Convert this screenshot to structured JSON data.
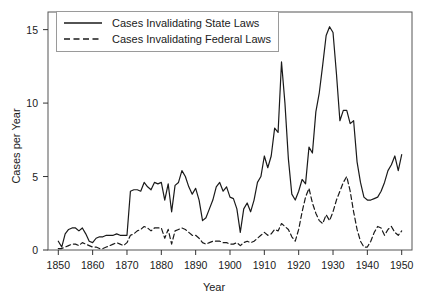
{
  "chart_data": {
    "type": "line",
    "title": "",
    "xlabel": "Year",
    "ylabel": "Cases per Year",
    "xlim": [
      1847,
      1953
    ],
    "ylim": [
      0,
      16.2
    ],
    "xticks": [
      1850,
      1860,
      1870,
      1880,
      1890,
      1900,
      1910,
      1920,
      1930,
      1940,
      1950
    ],
    "yticks": [
      0,
      5,
      10,
      15
    ],
    "grid": false,
    "legend_position": "upper-left",
    "series": [
      {
        "name": "Cases Invalidating State Laws",
        "style": "solid",
        "color": "#1a1a1a",
        "x": [
          1850,
          1851,
          1852,
          1853,
          1854,
          1855,
          1856,
          1857,
          1858,
          1859,
          1860,
          1861,
          1862,
          1863,
          1864,
          1865,
          1866,
          1867,
          1868,
          1869,
          1870,
          1871,
          1872,
          1873,
          1874,
          1875,
          1876,
          1877,
          1878,
          1879,
          1880,
          1881,
          1882,
          1883,
          1884,
          1885,
          1886,
          1887,
          1888,
          1889,
          1890,
          1891,
          1892,
          1893,
          1894,
          1895,
          1896,
          1897,
          1898,
          1899,
          1900,
          1901,
          1902,
          1903,
          1904,
          1905,
          1906,
          1907,
          1908,
          1909,
          1910,
          1911,
          1912,
          1913,
          1914,
          1915,
          1916,
          1917,
          1918,
          1919,
          1920,
          1921,
          1922,
          1923,
          1924,
          1925,
          1926,
          1927,
          1928,
          1929,
          1930,
          1931,
          1932,
          1933,
          1934,
          1935,
          1936,
          1937,
          1938,
          1939,
          1940,
          1941,
          1942,
          1943,
          1944,
          1945,
          1946,
          1947,
          1948,
          1949,
          1950
        ],
        "values": [
          0.6,
          0.2,
          1.1,
          1.4,
          1.5,
          1.5,
          1.3,
          1.5,
          1.1,
          0.6,
          0.5,
          0.8,
          0.9,
          0.9,
          1.0,
          1.0,
          1.0,
          1.1,
          1.0,
          1.0,
          1.0,
          4.0,
          4.1,
          4.1,
          4.0,
          4.6,
          4.3,
          4.1,
          4.6,
          4.5,
          4.6,
          3.4,
          4.5,
          2.6,
          4.4,
          4.6,
          5.4,
          5.0,
          4.3,
          3.8,
          4.2,
          3.4,
          2.0,
          2.2,
          2.8,
          3.4,
          4.3,
          4.6,
          4.0,
          4.3,
          3.6,
          3.5,
          2.8,
          1.2,
          2.8,
          3.2,
          2.6,
          3.4,
          4.6,
          5.0,
          6.4,
          5.6,
          6.4,
          8.3,
          8.0,
          12.8,
          10.0,
          6.2,
          3.8,
          3.4,
          4.0,
          4.8,
          4.5,
          7.0,
          6.6,
          9.4,
          10.7,
          12.6,
          14.6,
          15.2,
          14.8,
          12.0,
          8.8,
          9.5,
          9.5,
          8.6,
          8.8,
          6.0,
          4.6,
          3.6,
          3.4,
          3.4,
          3.5,
          3.6,
          4.0,
          4.6,
          5.4,
          5.8,
          6.4,
          5.4,
          6.5
        ]
      },
      {
        "name": "Cases Invalidating Federal Laws",
        "style": "dashed",
        "color": "#1a1a1a",
        "x": [
          1850,
          1851,
          1852,
          1853,
          1854,
          1855,
          1856,
          1857,
          1858,
          1859,
          1860,
          1861,
          1862,
          1863,
          1864,
          1865,
          1866,
          1867,
          1868,
          1869,
          1870,
          1871,
          1872,
          1873,
          1874,
          1875,
          1876,
          1877,
          1878,
          1879,
          1880,
          1881,
          1882,
          1883,
          1884,
          1885,
          1886,
          1887,
          1888,
          1889,
          1890,
          1891,
          1892,
          1893,
          1894,
          1895,
          1896,
          1897,
          1898,
          1899,
          1900,
          1901,
          1902,
          1903,
          1904,
          1905,
          1906,
          1907,
          1908,
          1909,
          1910,
          1911,
          1912,
          1913,
          1914,
          1915,
          1916,
          1917,
          1918,
          1919,
          1920,
          1921,
          1922,
          1923,
          1924,
          1925,
          1926,
          1927,
          1928,
          1929,
          1930,
          1931,
          1932,
          1933,
          1934,
          1935,
          1936,
          1937,
          1938,
          1939,
          1940,
          1941,
          1942,
          1943,
          1944,
          1945,
          1946,
          1947,
          1948,
          1949,
          1950
        ],
        "values": [
          0.1,
          0.1,
          0.2,
          0.3,
          0.4,
          0.4,
          0.3,
          0.5,
          0.4,
          0.3,
          0.2,
          0.2,
          0.1,
          0.1,
          0.2,
          0.3,
          0.4,
          0.5,
          0.4,
          0.3,
          0.5,
          1.0,
          1.1,
          1.3,
          1.4,
          1.6,
          1.5,
          1.3,
          1.5,
          1.5,
          1.5,
          0.8,
          1.4,
          0.4,
          1.3,
          1.4,
          1.5,
          1.4,
          1.2,
          1.0,
          1.0,
          0.8,
          0.5,
          0.4,
          0.5,
          0.6,
          0.6,
          0.6,
          0.5,
          0.5,
          0.4,
          0.4,
          0.5,
          0.3,
          0.5,
          0.6,
          0.5,
          0.6,
          0.8,
          1.0,
          1.2,
          1.0,
          1.1,
          1.4,
          1.3,
          1.8,
          1.6,
          1.4,
          0.9,
          0.6,
          1.4,
          2.6,
          3.6,
          4.2,
          3.2,
          2.5,
          2.0,
          1.8,
          2.4,
          2.0,
          2.6,
          3.4,
          4.0,
          4.6,
          5.0,
          4.0,
          2.6,
          1.4,
          0.6,
          0.2,
          0.2,
          0.6,
          1.2,
          1.6,
          1.5,
          1.0,
          1.4,
          1.6,
          1.2,
          1.0,
          1.3
        ]
      }
    ]
  },
  "legend": {
    "items": [
      {
        "label": "Cases Invalidating State Laws",
        "style": "solid"
      },
      {
        "label": "Cases Invalidating Federal Laws",
        "style": "dashed"
      }
    ]
  },
  "axes": {
    "xlabel": "Year",
    "ylabel": "Cases per Year",
    "xticks": [
      "1850",
      "1860",
      "1870",
      "1880",
      "1890",
      "1900",
      "1910",
      "1920",
      "1930",
      "1940",
      "1950"
    ],
    "yticks": [
      "0",
      "5",
      "10",
      "15"
    ]
  }
}
